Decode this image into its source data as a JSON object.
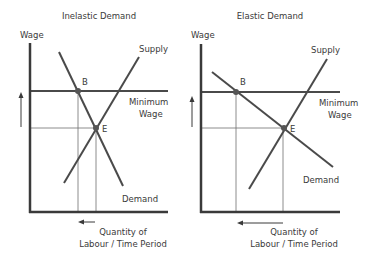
{
  "panels": [
    {
      "title": "Inelastic Demand",
      "y_axis_label": "Wage",
      "supply_label": "Supply",
      "min_wage_label_line1": "Minimum",
      "min_wage_label_line2": "Wage",
      "demand_label": "Demand",
      "point_b_label": "B",
      "point_e_label": "E",
      "x_axis_label_line1": "Quantity of",
      "x_axis_label_line2": "Labour / Time Period"
    },
    {
      "title": "Elastic Demand",
      "y_axis_label": "Wage",
      "supply_label": "Supply",
      "min_wage_label_line1": "Minimum",
      "min_wage_label_line2": "Wage",
      "demand_label": "Demand",
      "point_b_label": "B",
      "point_e_label": "E",
      "x_axis_label_line1": "Quantity of",
      "x_axis_label_line2": "Labour / Time Period"
    }
  ],
  "colors": {
    "line": "#4a4a4a",
    "thin_line": "#6e6e6e",
    "text": "#3a3a3a"
  }
}
